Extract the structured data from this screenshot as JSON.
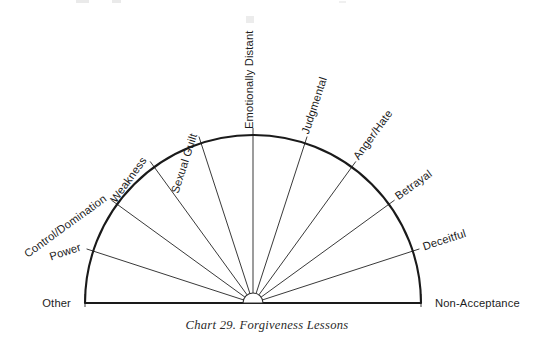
{
  "figure": {
    "caption": "Chart 29. Forgiveness Lessons",
    "background_color": "#ffffff",
    "line_color": "#1a1a1a"
  },
  "chart_data": {
    "type": "pie",
    "title": "Chart 29. Forgiveness Lessons",
    "subtitle": "",
    "xlabel": "",
    "ylabel": "",
    "legend": "none",
    "grid": false,
    "shape": "semicircle",
    "note": "Blank semicircular worksheet divided into 10 equal 18-degree wedges by 11 labeled radial spokes; no data values are plotted.",
    "center": {
      "x": 253,
      "y": 303
    },
    "radius": 168,
    "hub_radius": 10,
    "angle_start_deg": 0,
    "angle_end_deg": 180,
    "wedge_count": 10,
    "spoke_count": 11,
    "angle_step_deg": 18,
    "categories": [
      "Other",
      "Power",
      "Control/Domination",
      "Weakness",
      "Sexual Guilt",
      "Emotionally Distant",
      "Judgmental",
      "Anger/Hate",
      "Betrayal",
      "Deceitful",
      "Non-Acceptance"
    ],
    "values": [
      0,
      0,
      0,
      0,
      0,
      0,
      0,
      0,
      0,
      0,
      0
    ],
    "spokes": [
      {
        "label": "Other",
        "angle_deg": 180,
        "side": "left",
        "rotate": 0
      },
      {
        "label": "Power",
        "angle_deg": 162,
        "side": "left",
        "rotate": -18
      },
      {
        "label": "Control/Domination",
        "angle_deg": 144,
        "side": "left",
        "rotate": -36
      },
      {
        "label": "Weakness",
        "angle_deg": 126,
        "side": "left",
        "rotate": -54
      },
      {
        "label": "Sexual Guilt",
        "angle_deg": 108,
        "side": "left",
        "rotate": -72
      },
      {
        "label": "Emotionally Distant",
        "angle_deg": 90,
        "side": "top",
        "rotate": -90
      },
      {
        "label": "Judgmental",
        "angle_deg": 72,
        "side": "right",
        "rotate": -72
      },
      {
        "label": "Anger/Hate",
        "angle_deg": 54,
        "side": "right",
        "rotate": -54
      },
      {
        "label": "Betrayal",
        "angle_deg": 36,
        "side": "right",
        "rotate": -36
      },
      {
        "label": "Deceitful",
        "angle_deg": 18,
        "side": "right",
        "rotate": -18
      },
      {
        "label": "Non-Acceptance",
        "angle_deg": 0,
        "side": "right",
        "rotate": 0
      }
    ]
  }
}
